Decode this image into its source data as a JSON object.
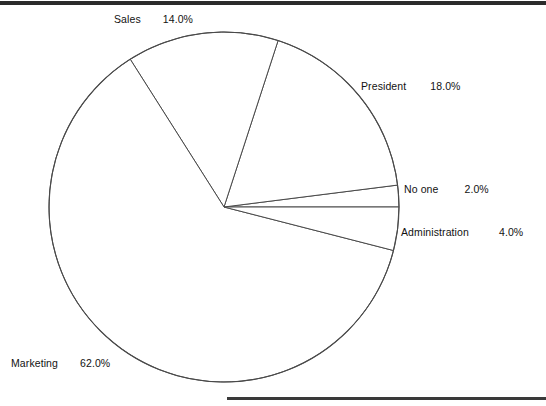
{
  "figure": {
    "background_color": "#ffffff",
    "line_color": "#4a4a4a",
    "text_color": "#121212",
    "rule_top_color": "#2b2b2b",
    "rule_bottom_color": "#3a3a3a"
  },
  "labels": {
    "sales": {
      "name": "Sales",
      "pct": "14.0%"
    },
    "president": {
      "name": "President",
      "pct": "18.0%"
    },
    "noone": {
      "name": "No one",
      "pct": "2.0%"
    },
    "administration": {
      "name": "Administration",
      "pct": "4.0%"
    },
    "marketing": {
      "name": "Marketing",
      "pct": "62.0%"
    }
  },
  "chart_data": {
    "type": "pie",
    "title": "",
    "subtitle": "",
    "xlabel": "",
    "ylabel": "",
    "categories": [
      "No one",
      "President",
      "Sales",
      "Marketing",
      "Administration"
    ],
    "values": [
      2.0,
      18.0,
      14.0,
      62.0,
      4.0
    ],
    "value_unit": "percent",
    "labels_formatted": [
      "2.0%",
      "18.0%",
      "14.0%",
      "62.0%",
      "4.0%"
    ],
    "slices": [
      {
        "label": "No one",
        "value": 2.0,
        "display": "2.0%",
        "start_angle_deg": 0.0,
        "end_angle_deg": 7.2,
        "fill": "#ffffff",
        "stroke": "#4a4a4a"
      },
      {
        "label": "President",
        "value": 18.0,
        "display": "18.0%",
        "start_angle_deg": 7.2,
        "end_angle_deg": 72.0,
        "fill": "#ffffff",
        "stroke": "#4a4a4a"
      },
      {
        "label": "Sales",
        "value": 14.0,
        "display": "14.0%",
        "start_angle_deg": 72.0,
        "end_angle_deg": 122.4,
        "fill": "#ffffff",
        "stroke": "#4a4a4a"
      },
      {
        "label": "Marketing",
        "value": 62.0,
        "display": "62.0%",
        "start_angle_deg": 122.4,
        "end_angle_deg": 345.6,
        "fill": "#ffffff",
        "stroke": "#4a4a4a"
      },
      {
        "label": "Administration",
        "value": 4.0,
        "display": "4.0%",
        "start_angle_deg": 345.6,
        "end_angle_deg": 360.0,
        "fill": "#ffffff",
        "stroke": "#4a4a4a"
      }
    ],
    "total": 100.0,
    "start_angle_deg": 0,
    "direction": "counterclockwise",
    "legend": "none",
    "labels_position": "outside",
    "grid": false,
    "center_px": [
      224,
      207
    ],
    "radius_px": 175
  }
}
